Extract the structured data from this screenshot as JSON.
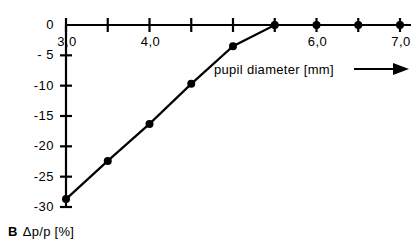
{
  "chart_data": {
    "type": "line",
    "title": "",
    "subtitle": "",
    "panel_label": "B",
    "xlabel": "pupil  diameter  [mm]",
    "ylabel": "Δp/p  [%]",
    "xlim": [
      3.0,
      7.0
    ],
    "ylim": [
      -30,
      0
    ],
    "grid": false,
    "legend": null,
    "x_tick_values": [
      3.0,
      3.5,
      4.0,
      4.5,
      5.0,
      5.5,
      6.0,
      6.5,
      7.0
    ],
    "x_tick_labels": [
      "3,0",
      "",
      "4,0",
      "",
      "",
      "",
      "6,0",
      "",
      "7,0"
    ],
    "y_tick_values": [
      0,
      -5,
      -10,
      -15,
      -20,
      -25,
      -30
    ],
    "y_tick_labels": [
      "0",
      "- 5",
      "-10",
      "-15",
      "-20",
      "-25",
      "-30"
    ],
    "series": [
      {
        "name": "Δp/p",
        "marker": "filled-circle",
        "x": [
          3.0,
          3.5,
          4.0,
          4.5,
          5.0,
          5.5,
          6.0,
          6.5,
          7.0
        ],
        "values": [
          -28.7,
          -22.4,
          -16.3,
          -9.7,
          -3.5,
          0.0,
          0.0,
          0.0,
          0.0
        ]
      }
    ],
    "annotations": [
      {
        "name": "x-axis-arrow",
        "text": "→",
        "after": "pupil  diameter  [mm]"
      }
    ]
  },
  "labels": {
    "x_axis_title": "pupil  diameter  [mm]",
    "y_axis_title": "Δp/p  [%]",
    "panel_letter": "B"
  },
  "colors": {
    "axis": "#000000",
    "line": "#000000",
    "marker": "#000000",
    "background": "#ffffff"
  }
}
